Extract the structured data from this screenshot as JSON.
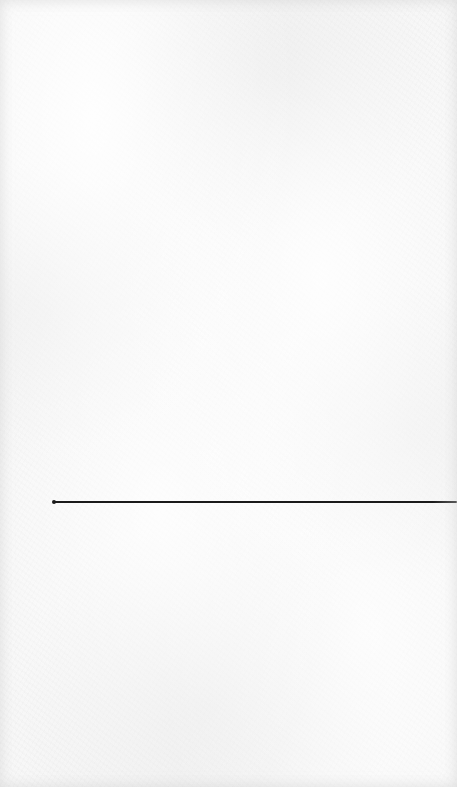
{
  "page": {
    "background_color": "#f7f7f7",
    "texture": "paper"
  },
  "rule": {
    "x_start": 53,
    "x_end": 457,
    "y": 502,
    "thickness": 2,
    "color": "#1a1a1a",
    "end_dot": true
  }
}
